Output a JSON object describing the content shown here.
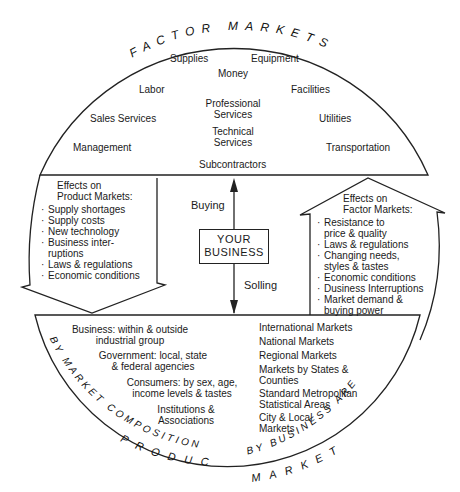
{
  "diagram": {
    "arc_titles": {
      "top_left": "FACTOR",
      "top_right": "MARKETS",
      "bottom_left_inner": "BY MARKET COMPOSITION",
      "bottom_left_outer": "PRODUCT",
      "bottom_right_inner": "BY BUSINESS AREA",
      "bottom_right_outer": "MARKETS"
    },
    "factor_markets": {
      "supplies": "Supplies",
      "equipment": "Equipment",
      "money": "Money",
      "labor": "Labor",
      "facilities": "Facilities",
      "professional_services": [
        "Professional",
        "Services"
      ],
      "technical_services": [
        "Technical",
        "Services"
      ],
      "sales_services": "Sales Services",
      "utilities": "Utilities",
      "management": "Management",
      "transportation": "Transportation",
      "subcontractors": "Subcontractors"
    },
    "center": {
      "box": [
        "YOUR",
        "BUSINESS"
      ],
      "buying": "Buying",
      "selling": "Solling"
    },
    "effects_product": {
      "title": [
        "Effects on",
        "Product Markets:"
      ],
      "items": [
        [
          "Supply shortages"
        ],
        [
          "Supply costs"
        ],
        [
          "New technology"
        ],
        [
          "Business inter-",
          "ruptions"
        ],
        [
          "Laws & regulations"
        ],
        [
          "Economic conditions"
        ]
      ]
    },
    "effects_factor": {
      "title": [
        "Effects on",
        "Factor Markets:"
      ],
      "items": [
        [
          "Resistance to",
          "price & quality"
        ],
        [
          "Laws & regulations"
        ],
        [
          "Changing needs,",
          "styles & tastes"
        ],
        [
          "Economic conditions"
        ],
        [
          "Dusiness Interruptions"
        ],
        [
          "Market demand &",
          "buying power"
        ]
      ]
    },
    "market_composition": [
      [
        "Business: within & outside",
        "industrial group"
      ],
      [
        "Government: local, state",
        "& federal agencies"
      ],
      [
        "Consumers: by sex, age,",
        "income levels & tastes"
      ],
      [
        "Institutions &",
        "Associations"
      ]
    ],
    "business_area": [
      [
        "International Markets"
      ],
      [
        "National Markets"
      ],
      [
        "Regional Markets"
      ],
      [
        "Markets by States &",
        "Counties"
      ],
      [
        "Standard Metropolitan",
        "Statistical Areas"
      ],
      [
        "City & Local",
        "Markets"
      ]
    ]
  }
}
